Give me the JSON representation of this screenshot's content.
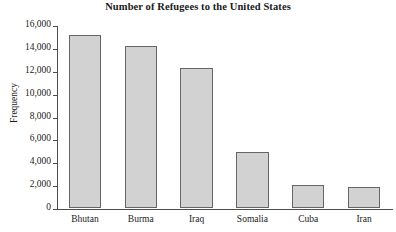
{
  "chart_data": {
    "type": "bar",
    "title": "Number of Refugees to the United States",
    "xlabel": "",
    "ylabel": "Frequency",
    "categories": [
      "Bhutan",
      "Burma",
      "Iraq",
      "Somalia",
      "Cuba",
      "Iran"
    ],
    "values": [
      15100,
      14200,
      12200,
      4900,
      2000,
      1800
    ],
    "ylim": [
      0,
      16000
    ],
    "yticks": [
      0,
      2000,
      4000,
      6000,
      8000,
      10000,
      12000,
      14000,
      16000
    ],
    "ytick_labels": [
      "0",
      "2,000",
      "4,000",
      "6,000",
      "8,000",
      "10,000",
      "12,000",
      "14,000",
      "16,000"
    ],
    "grid": false,
    "legend": null,
    "bar_color": "#d2d2d2",
    "bar_border_color": "#666666",
    "axis_color": "#4c4c4c",
    "text_color": "#1a1a1a"
  }
}
